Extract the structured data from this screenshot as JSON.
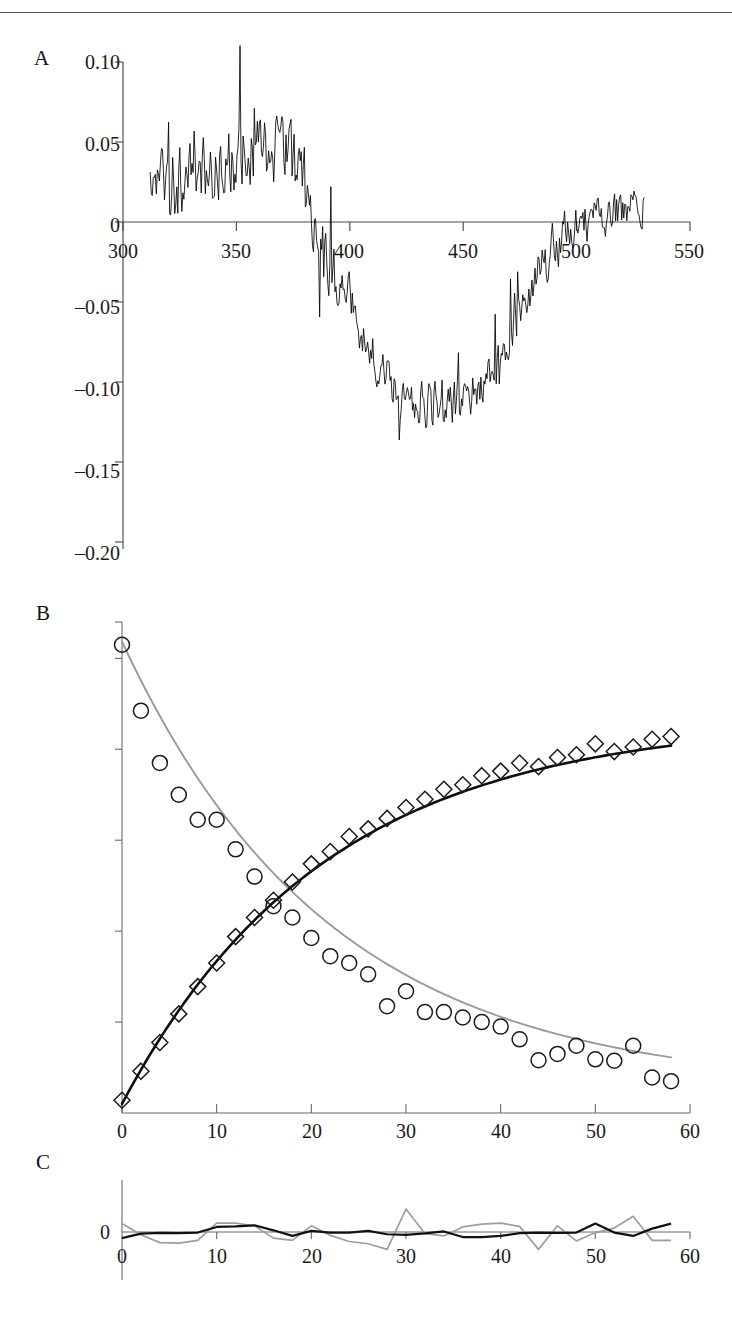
{
  "figure": {
    "panels": [
      {
        "id": "A",
        "label": "A"
      },
      {
        "id": "B",
        "label": "B"
      },
      {
        "id": "C",
        "label": "C"
      }
    ]
  },
  "chart_data": [
    {
      "panel": "A",
      "type": "line",
      "title": "",
      "xlabel": "",
      "ylabel": "",
      "xlim": [
        300,
        550
      ],
      "ylim": [
        -0.2,
        0.1
      ],
      "xticks": [
        300,
        350,
        400,
        450,
        500,
        550
      ],
      "xtick_labels": [
        "300",
        "350",
        "400",
        "450",
        "500",
        "550"
      ],
      "yticks": [
        0.1,
        0.05,
        0,
        -0.05,
        -0.1,
        -0.15,
        -0.2
      ],
      "ytick_labels": [
        "0.10",
        "0.05",
        "0",
        "–0.05",
        "–0.10",
        "–0.15",
        "–0.20"
      ],
      "grid": false,
      "legend": "none",
      "series": [
        {
          "name": "difference-spectrum",
          "color": "#000000",
          "noise_amplitude": 0.018,
          "x_start": 312,
          "x_end": 530,
          "x_step": 0.45,
          "envelope_x": [
            312,
            320,
            330,
            340,
            350,
            356,
            362,
            368,
            374,
            380,
            386,
            392,
            398,
            404,
            410,
            416,
            422,
            428,
            434,
            440,
            446,
            452,
            458,
            464,
            470,
            476,
            482,
            488,
            494,
            500,
            506,
            512,
            518,
            524,
            530
          ],
          "envelope_y": [
            0.02,
            0.024,
            0.028,
            0.034,
            0.04,
            0.046,
            0.047,
            0.044,
            0.04,
            0.022,
            -0.01,
            -0.03,
            -0.048,
            -0.065,
            -0.082,
            -0.096,
            -0.108,
            -0.113,
            -0.116,
            -0.115,
            -0.112,
            -0.11,
            -0.104,
            -0.092,
            -0.076,
            -0.056,
            -0.036,
            -0.02,
            -0.008,
            -0.001,
            0.003,
            0.005,
            0.006,
            0.007,
            0.006
          ]
        }
      ]
    },
    {
      "panel": "B",
      "type": "scatter",
      "title": "",
      "xlabel": "",
      "ylabel": "",
      "xlim": [
        0,
        60
      ],
      "ylim": [
        0,
        1.08
      ],
      "xticks": [
        0,
        10,
        20,
        30,
        40,
        50,
        60
      ],
      "xtick_labels": [
        "0",
        "10",
        "20",
        "30",
        "40",
        "50",
        "60"
      ],
      "yticks": [
        0.0,
        0.2,
        0.4,
        0.6,
        0.8,
        1.0
      ],
      "ytick_labels": [
        "",
        "",
        "",
        "",
        "",
        ""
      ],
      "grid": false,
      "legend": "none",
      "series": [
        {
          "name": "decay-circles",
          "marker": "circle",
          "color": "#1a1a1a",
          "x": [
            0,
            2,
            4,
            6,
            8,
            10,
            12,
            14,
            16,
            18,
            20,
            22,
            24,
            26,
            28,
            30,
            32,
            34,
            36,
            38,
            40,
            42,
            44,
            46,
            48,
            50,
            52,
            54,
            56,
            58
          ],
          "y": [
            1.03,
            0.885,
            0.77,
            0.7,
            0.645,
            0.645,
            0.58,
            0.52,
            0.455,
            0.43,
            0.385,
            0.345,
            0.33,
            0.305,
            0.235,
            0.268,
            0.222,
            0.222,
            0.21,
            0.2,
            0.19,
            0.162,
            0.116,
            0.13,
            0.148,
            0.118,
            0.115,
            0.148,
            0.078,
            0.07
          ]
        },
        {
          "name": "decay-fit",
          "curve": true,
          "color": "#9a9a9a",
          "model": "exponential-decay",
          "amplitude": 0.985,
          "rate": 0.0455,
          "offset": 0.052,
          "x_start": 0,
          "x_end": 58
        },
        {
          "name": "rise-diamonds",
          "marker": "diamond",
          "color": "#1a1a1a",
          "x": [
            0,
            2,
            4,
            6,
            8,
            10,
            12,
            14,
            16,
            18,
            20,
            22,
            24,
            26,
            28,
            30,
            32,
            34,
            36,
            38,
            40,
            42,
            44,
            46,
            48,
            50,
            52,
            54,
            56,
            58
          ],
          "y": [
            0.028,
            0.092,
            0.155,
            0.218,
            0.278,
            0.33,
            0.388,
            0.43,
            0.468,
            0.508,
            0.548,
            0.575,
            0.608,
            0.625,
            0.648,
            0.672,
            0.69,
            0.712,
            0.722,
            0.742,
            0.752,
            0.77,
            0.762,
            0.782,
            0.788,
            0.812,
            0.795,
            0.805,
            0.822,
            0.828
          ]
        },
        {
          "name": "rise-fit",
          "curve": true,
          "color": "#0d0d0d",
          "model": "exponential-rise",
          "amplitude": 0.845,
          "rate": 0.0465,
          "offset": 0.02,
          "x_start": 0,
          "x_end": 58
        }
      ]
    },
    {
      "panel": "C",
      "type": "line",
      "title": "",
      "xlabel": "",
      "ylabel": "",
      "xlim": [
        0,
        60
      ],
      "ylim": [
        -1,
        1
      ],
      "xticks": [
        0,
        10,
        20,
        30,
        40,
        50,
        60
      ],
      "xtick_labels": [
        "0",
        "10",
        "20",
        "30",
        "40",
        "50",
        "60"
      ],
      "yticks": [
        0
      ],
      "ytick_labels": [
        "0"
      ],
      "grid": false,
      "legend": "none",
      "series": [
        {
          "name": "residuals-black",
          "color": "#111111",
          "x": [
            0,
            2,
            4,
            6,
            8,
            10,
            12,
            14,
            16,
            18,
            20,
            22,
            24,
            26,
            28,
            30,
            32,
            34,
            36,
            38,
            40,
            42,
            44,
            46,
            48,
            50,
            52,
            54,
            56,
            58
          ],
          "y": [
            -0.22,
            -0.06,
            -0.03,
            -0.04,
            -0.02,
            0.18,
            0.2,
            0.24,
            0.06,
            -0.14,
            0.04,
            -0.02,
            -0.02,
            0.04,
            -0.08,
            -0.1,
            -0.05,
            0.02,
            -0.18,
            -0.18,
            -0.14,
            -0.04,
            -0.02,
            -0.03,
            -0.02,
            0.3,
            -0.02,
            -0.14,
            0.12,
            0.3
          ]
        },
        {
          "name": "residuals-gray",
          "color": "#9e9e9e",
          "x": [
            0,
            2,
            4,
            6,
            8,
            10,
            12,
            14,
            16,
            18,
            20,
            22,
            24,
            26,
            28,
            30,
            32,
            34,
            36,
            38,
            40,
            42,
            44,
            46,
            48,
            50,
            52,
            54,
            56,
            58
          ],
          "y": [
            0.3,
            -0.1,
            -0.38,
            -0.4,
            -0.3,
            0.32,
            0.32,
            0.22,
            -0.22,
            -0.3,
            0.22,
            -0.12,
            -0.34,
            -0.42,
            -0.62,
            0.82,
            -0.06,
            -0.14,
            0.18,
            0.28,
            0.32,
            0.2,
            -0.62,
            0.22,
            -0.32,
            -0.02,
            0.14,
            0.56,
            -0.3,
            -0.3
          ]
        }
      ]
    }
  ]
}
